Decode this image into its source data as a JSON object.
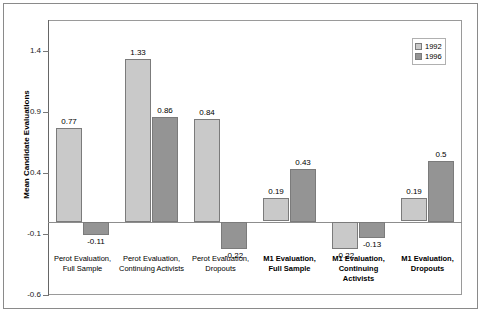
{
  "chart_data": {
    "type": "bar",
    "title": "",
    "xlabel": "",
    "ylabel": "Mean Candidate Evaluations",
    "ylim": [
      -0.6,
      1.65
    ],
    "yticks": [
      1.4,
      0.9,
      0.4,
      -0.1,
      -0.6
    ],
    "ytick_labels": [
      "1.4",
      "0.9",
      "0.4",
      "-0.1",
      "-0.6"
    ],
    "grid": false,
    "legend_position": "top-right",
    "categories": [
      "Perot Evaluation,\nFull Sample",
      "Perot Evaluation,\nContinuing Activists",
      "Perot Evaluation,\nDropouts",
      "M1 Evaluation,\nFull Sample",
      "M1 Evaluation,\nContinuing Activists",
      "M1 Evaluation,\nDropouts"
    ],
    "categories_bold": [
      false,
      false,
      false,
      true,
      true,
      true
    ],
    "series": [
      {
        "name": "1992",
        "color": "#c9c9c9",
        "values": [
          0.77,
          1.33,
          0.84,
          0.19,
          -0.22,
          0.19
        ],
        "labels": [
          "0.77",
          "1.33",
          "0.84",
          "0.19",
          "-0.22",
          "0.19"
        ]
      },
      {
        "name": "1996",
        "color": "#949494",
        "values": [
          -0.11,
          0.86,
          -0.22,
          0.43,
          -0.13,
          0.5
        ],
        "labels": [
          "-0.11",
          "0.86",
          "-0.22",
          "0.43",
          "-0.13",
          "0.5"
        ]
      }
    ]
  },
  "legend": {
    "items": [
      {
        "label": "1992",
        "color": "#c9c9c9"
      },
      {
        "label": "1996",
        "color": "#949494"
      }
    ]
  }
}
